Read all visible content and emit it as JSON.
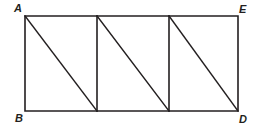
{
  "figure": {
    "stroke_color": "#231f20",
    "background_color": "#ffffff",
    "geometry": {
      "rectangle": {
        "left": 25,
        "top": 16,
        "right": 238,
        "bottom": 111
      },
      "vertical_dividers_x": [
        97,
        169
      ],
      "diagonals": [
        {
          "x1": 25,
          "y1": 16,
          "x2": 97,
          "y2": 111
        },
        {
          "x1": 97,
          "y1": 16,
          "x2": 169,
          "y2": 111
        },
        {
          "x1": 169,
          "y1": 16,
          "x2": 238,
          "y2": 111
        }
      ]
    },
    "labels": [
      {
        "id": "A",
        "text": "A",
        "position": "top-left"
      },
      {
        "id": "E",
        "text": "E",
        "position": "top-right"
      },
      {
        "id": "B",
        "text": "B",
        "position": "bottom-left"
      },
      {
        "id": "D",
        "text": "D",
        "position": "bottom-right"
      }
    ]
  }
}
